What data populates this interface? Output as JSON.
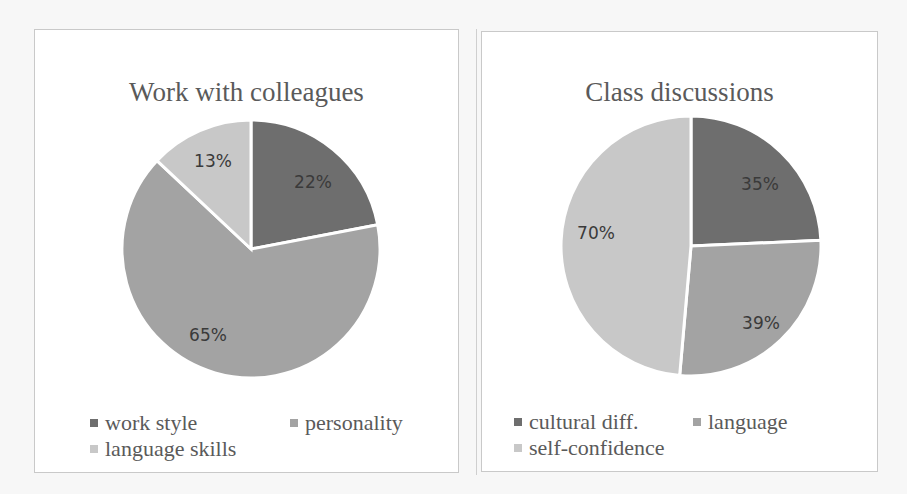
{
  "chart_data": [
    {
      "type": "pie",
      "title": "Work with colleagues",
      "categories": [
        "work style",
        "personality",
        "language skills"
      ],
      "values": [
        22,
        65,
        13
      ],
      "labels": [
        "22%",
        "65%",
        "13%"
      ],
      "colors": [
        "#6e6e6e",
        "#a3a3a3",
        "#c8c8c8"
      ],
      "legend_position": "bottom"
    },
    {
      "type": "pie",
      "title": "Class discussions",
      "categories": [
        "cultural diff.",
        "language",
        "self-confidence"
      ],
      "values": [
        35,
        39,
        70
      ],
      "labels": [
        "35%",
        "39%",
        "70%"
      ],
      "colors": [
        "#6e6e6e",
        "#a3a3a3",
        "#c8c8c8"
      ],
      "legend_position": "bottom"
    }
  ],
  "charts": {
    "left": {
      "title": "Work with colleagues",
      "legend": [
        "work style",
        "personality",
        "language skills"
      ],
      "labels": [
        "22%",
        "65%",
        "13%"
      ]
    },
    "right": {
      "title": "Class discussions",
      "legend": [
        "cultural diff.",
        "language",
        "self-confidence"
      ],
      "labels": [
        "35%",
        "39%",
        "70%"
      ]
    }
  }
}
